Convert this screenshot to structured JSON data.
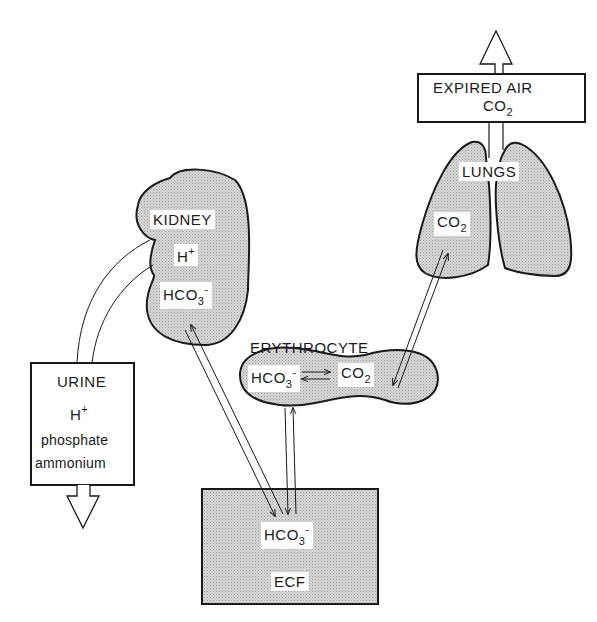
{
  "diagram": {
    "type": "physiology flow diagram",
    "colors": {
      "stroke": "#1a1a1a",
      "fill_stipple": "#cfcfcf",
      "background": "#ffffff"
    },
    "nodes": {
      "expired_air": {
        "title": "EXPIRED AIR",
        "species": "CO",
        "species_sub": "2"
      },
      "lungs": {
        "title": "LUNGS",
        "species": "CO",
        "species_sub": "2"
      },
      "kidney": {
        "title": "KIDNEY",
        "h_plus": "H",
        "h_plus_sup": "+",
        "bicarb": "HCO",
        "bicarb_sub": "3",
        "bicarb_sup": "-"
      },
      "urine": {
        "title": "URINE",
        "h_plus": "H",
        "h_plus_sup": "+",
        "item1": "phosphate",
        "item2": "ammonium"
      },
      "erythrocyte": {
        "title": "ERYTHROCYTE",
        "bicarb": "HCO",
        "bicarb_sub": "3",
        "bicarb_sup": "-",
        "co2": "CO",
        "co2_sub": "2",
        "reaction": "⇌"
      },
      "ecf": {
        "title": "ECF",
        "bicarb": "HCO",
        "bicarb_sub": "3",
        "bicarb_sup": "-"
      }
    },
    "edges": [
      {
        "from": "lungs",
        "to": "expired_air",
        "style": "open block arrow",
        "label": ""
      },
      {
        "from": "expired_air",
        "to": "outside",
        "style": "open block arrow up",
        "label": ""
      },
      {
        "from": "kidney",
        "to": "urine",
        "style": "curved open channel",
        "label": ""
      },
      {
        "from": "urine",
        "to": "outside",
        "style": "open block arrow down",
        "label": ""
      },
      {
        "from": "kidney",
        "to": "ecf",
        "style": "bidirectional thin arrows",
        "label": ""
      },
      {
        "from": "erythrocyte",
        "to": "ecf",
        "style": "bidirectional thin arrows",
        "label": ""
      },
      {
        "from": "erythrocyte",
        "to": "lungs",
        "style": "bidirectional thin arrows",
        "label": ""
      }
    ]
  }
}
